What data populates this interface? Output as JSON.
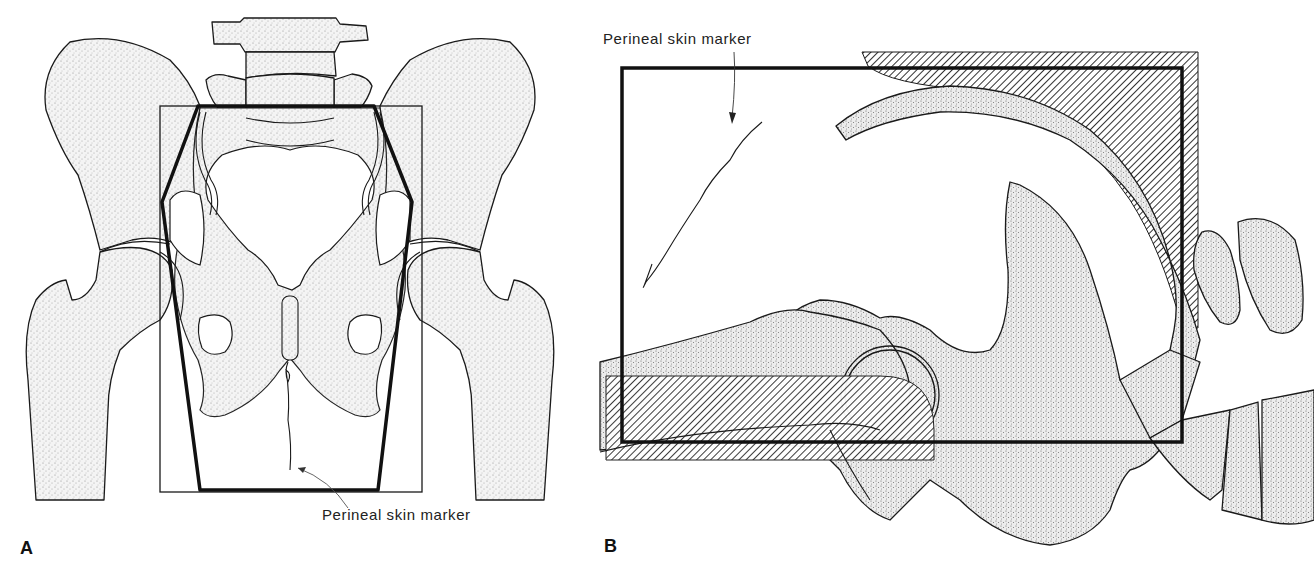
{
  "figure": {
    "panels": [
      {
        "id": "A",
        "letter": "A",
        "view": "anteroposterior pelvis",
        "annotation": "Perineal skin marker"
      },
      {
        "id": "B",
        "letter": "B",
        "view": "lateral pelvis",
        "annotation": "Perineal skin marker"
      }
    ],
    "colors": {
      "line": "#1a1a1a",
      "stipple": "#9a9a9a",
      "background": "#ffffff"
    }
  }
}
